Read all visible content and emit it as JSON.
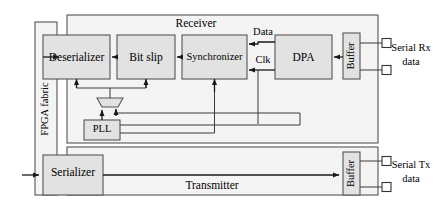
{
  "diagram": {
    "fabric": {
      "label": "FPGA fabric"
    },
    "receiver": {
      "label": "Receiver",
      "blocks": [
        {
          "id": "deserializer",
          "label": "Deserializer"
        },
        {
          "id": "bit-slip",
          "label": "Bit slip"
        },
        {
          "id": "synchronizer",
          "label": "Synchronizer"
        },
        {
          "id": "dpa",
          "label": "DPA"
        },
        {
          "id": "buffer-rx",
          "label": "Buffer"
        }
      ],
      "signals": [
        {
          "id": "data",
          "label": "Data"
        },
        {
          "id": "clk",
          "label": "Clk"
        }
      ],
      "port": {
        "label_line1": "Serial Rx",
        "label_line2": "data"
      }
    },
    "transmitter": {
      "label": "Transmitter",
      "blocks": [
        {
          "id": "serializer",
          "label": "Serializer"
        },
        {
          "id": "buffer-tx",
          "label": "Buffer"
        }
      ],
      "port": {
        "label_line1": "Serial Tx",
        "label_line2": "data"
      }
    },
    "clocking": {
      "pll": {
        "label": "PLL"
      },
      "mux": {
        "label": ""
      }
    },
    "colors": {
      "block_fill": "#e2e2e2",
      "container_fill": "#f4f4f4",
      "stroke": "#555555",
      "wire": "#1a1a1a",
      "background": "#ffffff"
    }
  }
}
